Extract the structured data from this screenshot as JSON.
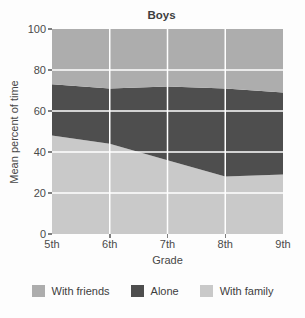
{
  "chart_data": {
    "type": "area",
    "stacked": true,
    "title": "Boys",
    "xlabel": "Grade",
    "ylabel": "Mean percent of time",
    "categories": [
      "5th",
      "6th",
      "7th",
      "8th",
      "9th"
    ],
    "series": [
      {
        "name": "With family",
        "color": "#c9c9c9",
        "values": [
          48,
          44,
          36,
          28,
          29
        ]
      },
      {
        "name": "Alone",
        "color": "#4e4e4e",
        "values": [
          25,
          27,
          36,
          43,
          40
        ]
      },
      {
        "name": "With friends",
        "color": "#adadad",
        "values": [
          27,
          29,
          28,
          29,
          31
        ]
      }
    ],
    "ylim": [
      0,
      100
    ],
    "yticks": [
      0,
      20,
      40,
      60,
      80,
      100
    ],
    "grid": true,
    "gridline_color": "#ffffff",
    "legend_position": "bottom",
    "legend": [
      {
        "label": "With friends",
        "color": "#adadad"
      },
      {
        "label": "Alone",
        "color": "#4e4e4e"
      },
      {
        "label": "With family",
        "color": "#c9c9c9"
      }
    ]
  }
}
